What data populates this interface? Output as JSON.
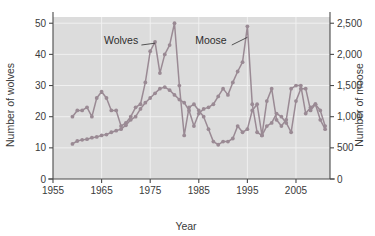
{
  "chart_data": {
    "type": "line",
    "title": "",
    "xlabel": "Year",
    "ylabel": "Number of wolves",
    "y2label": "Number of moose",
    "xlim": [
      1955,
      2012
    ],
    "ylim": [
      0,
      52
    ],
    "y2lim": [
      0,
      2600
    ],
    "grid": true,
    "legend_position": "inline-annotation",
    "xticks": [
      1955,
      1965,
      1975,
      1985,
      1995,
      2005
    ],
    "xticklabels": [
      "1955",
      "1965",
      "1975",
      "1985",
      "1995",
      "2005"
    ],
    "yticks": [
      0,
      10,
      20,
      30,
      40,
      50
    ],
    "yticklabels": [
      "0",
      "10",
      "20",
      "30",
      "40",
      "50"
    ],
    "y2ticks": [
      0,
      500,
      1000,
      1500,
      2000,
      2500
    ],
    "y2ticklabels": [
      "0",
      "500",
      "1,000",
      "1,500",
      "2,000",
      "2,500"
    ],
    "annotations": [
      {
        "text": "Wolves",
        "x": 1969.0,
        "y_axis": "left",
        "y": 44.5
      },
      {
        "text": "Moose",
        "x": 1987.5,
        "y_axis": "left",
        "y": 44.5
      }
    ],
    "series": [
      {
        "name": "Wolves",
        "axis": "left",
        "color": "#9a8a94",
        "x": [
          1959,
          1960,
          1961,
          1962,
          1963,
          1964,
          1965,
          1966,
          1967,
          1968,
          1969,
          1970,
          1971,
          1972,
          1973,
          1974,
          1975,
          1976,
          1977,
          1978,
          1979,
          1980,
          1981,
          1982,
          1983,
          1984,
          1985,
          1986,
          1987,
          1988,
          1989,
          1990,
          1991,
          1992,
          1993,
          1994,
          1995,
          1996,
          1997,
          1998,
          1999,
          2000,
          2001,
          2002,
          2003,
          2004,
          2005,
          2006,
          2007,
          2008,
          2009,
          2010,
          2011
        ],
        "values": [
          20,
          22,
          22,
          23,
          20,
          26,
          28,
          26,
          22,
          22,
          17,
          18,
          20,
          23,
          24,
          31,
          41,
          44,
          34,
          40,
          43,
          50,
          30,
          14,
          23,
          24,
          22,
          20,
          16,
          12,
          11,
          12,
          12,
          13,
          17,
          15,
          16,
          22,
          24,
          14,
          25,
          29,
          19,
          17,
          19,
          29,
          30,
          30,
          21,
          23,
          24,
          19,
          16
        ]
      },
      {
        "name": "Moose",
        "axis": "right",
        "color": "#9a8a94",
        "x": [
          1959,
          1960,
          1961,
          1962,
          1963,
          1964,
          1965,
          1966,
          1967,
          1968,
          1969,
          1970,
          1971,
          1972,
          1973,
          1974,
          1975,
          1976,
          1977,
          1978,
          1979,
          1980,
          1981,
          1982,
          1983,
          1984,
          1985,
          1986,
          1987,
          1988,
          1989,
          1990,
          1991,
          1992,
          1993,
          1994,
          1995,
          1996,
          1997,
          1998,
          1999,
          2000,
          2001,
          2002,
          2003,
          2004,
          2005,
          2006,
          2007,
          2008,
          2009,
          2010,
          2011
        ],
        "values": [
          563,
          610,
          628,
          639,
          663,
          675,
          700,
          713,
          750,
          775,
          800,
          863,
          950,
          1000,
          1125,
          1225,
          1300,
          1375,
          1450,
          1475,
          1425,
          1350,
          1275,
          1225,
          1100,
          850,
          1050,
          1125,
          1150,
          1200,
          1325,
          1450,
          1350,
          1550,
          1725,
          1875,
          2450,
          1200,
          750,
          700,
          850,
          900,
          1050,
          1000,
          900,
          750,
          1250,
          1450,
          1450,
          1100,
          1200,
          1100,
          850
        ]
      }
    ]
  }
}
